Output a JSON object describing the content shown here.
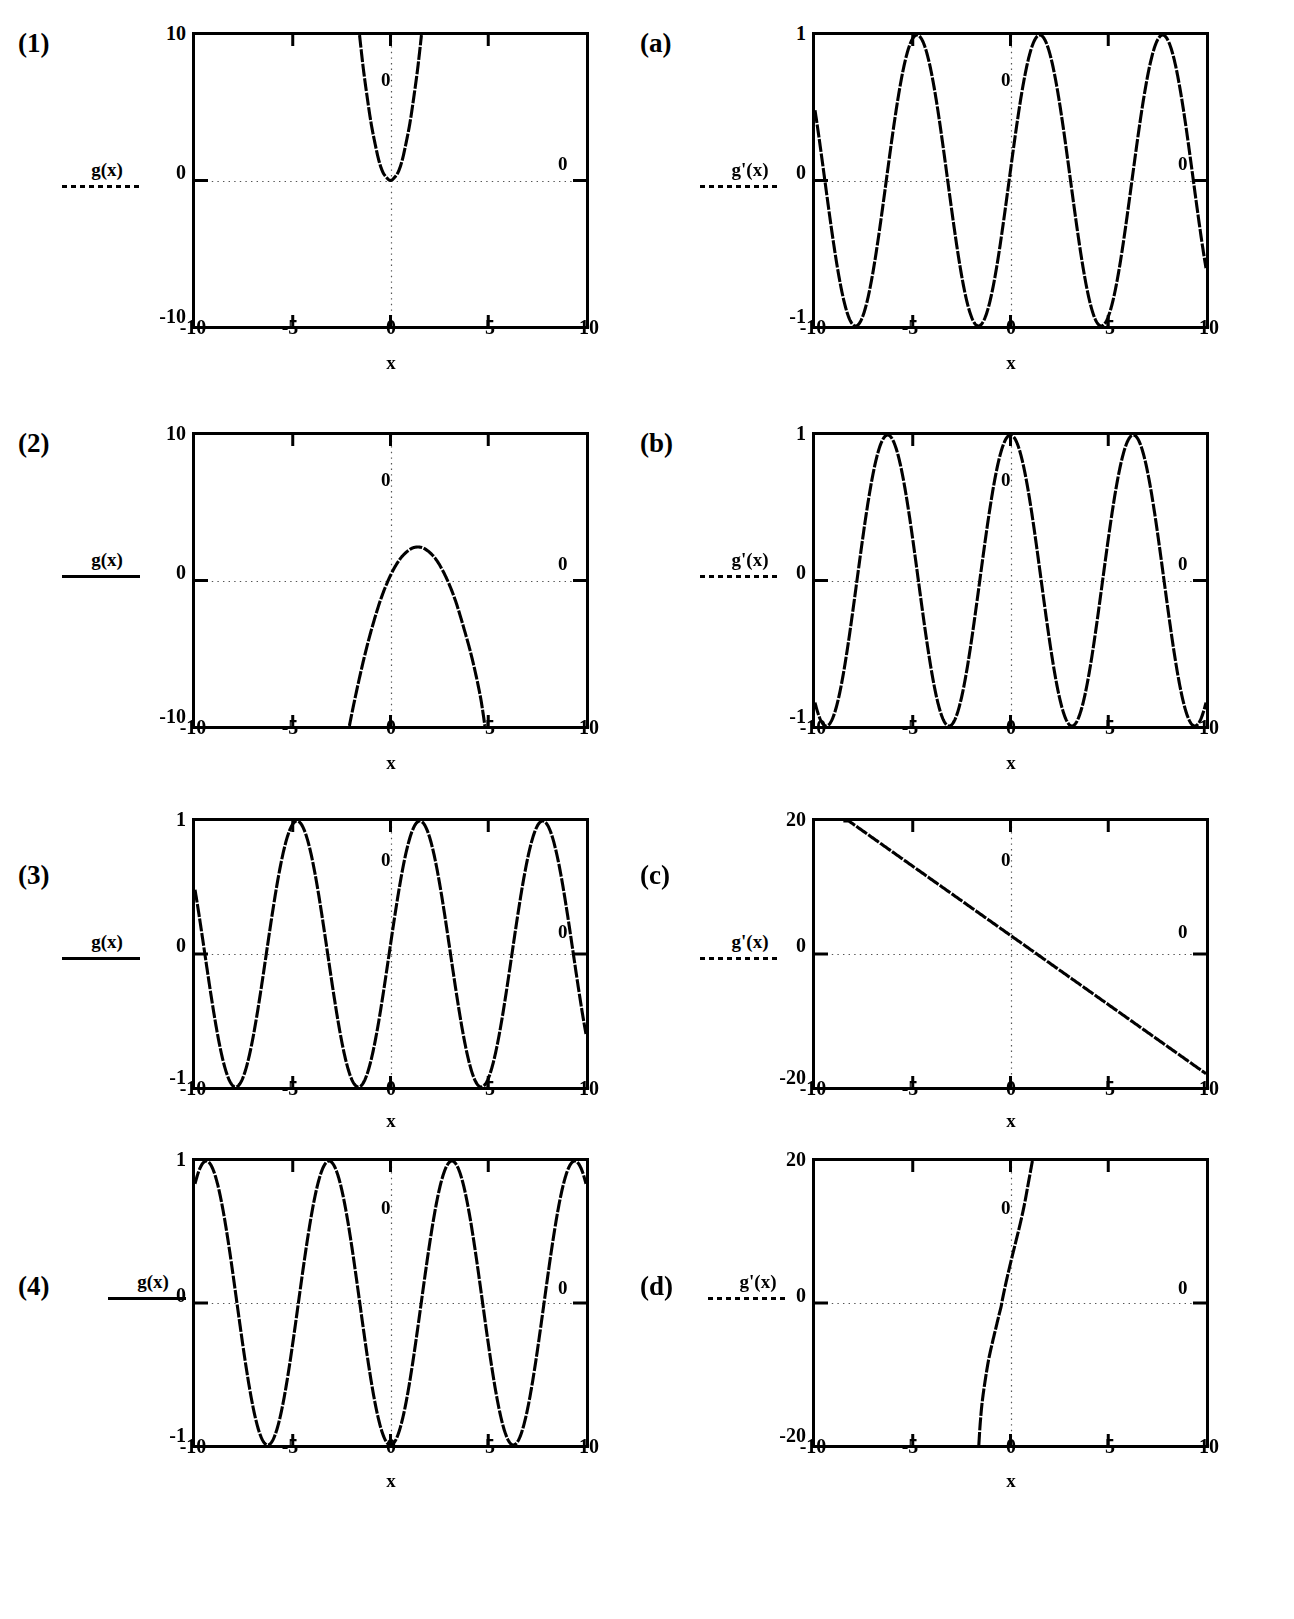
{
  "figure": {
    "background": "#ffffff",
    "ink": "#000000",
    "grid_note": "dotted reference lines at x=0 and y=0 inside each frame",
    "panel_count": 8
  },
  "panels": [
    {
      "tag": "(1)",
      "legend_label": "g(x)",
      "legend_style": "dotted",
      "xlabel": "x",
      "xticks": [
        "-10",
        "-5",
        "0",
        "5",
        "10"
      ],
      "yticks": [
        "10",
        "0",
        "-10"
      ],
      "inner_zero_labels": [
        "0",
        "0"
      ],
      "chart_data": {
        "type": "line",
        "title": "",
        "xlabel": "x",
        "ylabel": "g(x)",
        "xlim": [
          -10,
          10
        ],
        "ylim": [
          -10,
          10
        ],
        "xticks": [
          -10,
          -5,
          0,
          5,
          10
        ],
        "yticks": [
          -10,
          0,
          10
        ],
        "grid": "dotted zero lines only",
        "legend": "g(x)",
        "curve": "parabola-upward",
        "description": "Narrow upward parabola with vertex near (0,0); rises off the top of the frame at x = -1.6 and x = 1.6",
        "series": [
          {
            "name": "g(x)",
            "expression": "4*x^2",
            "points": [
              {
                "x": -1.6,
                "y": 10.2
              },
              {
                "x": -1.4,
                "y": 7.8
              },
              {
                "x": -1.2,
                "y": 5.8
              },
              {
                "x": -1.0,
                "y": 4.0
              },
              {
                "x": -0.8,
                "y": 2.6
              },
              {
                "x": -0.6,
                "y": 1.4
              },
              {
                "x": -0.4,
                "y": 0.6
              },
              {
                "x": -0.2,
                "y": 0.2
              },
              {
                "x": 0.0,
                "y": 0.0
              },
              {
                "x": 0.2,
                "y": 0.2
              },
              {
                "x": 0.4,
                "y": 0.6
              },
              {
                "x": 0.6,
                "y": 1.4
              },
              {
                "x": 0.8,
                "y": 2.6
              },
              {
                "x": 1.0,
                "y": 4.0
              },
              {
                "x": 1.2,
                "y": 5.8
              },
              {
                "x": 1.4,
                "y": 7.8
              },
              {
                "x": 1.6,
                "y": 10.2
              }
            ]
          }
        ]
      }
    },
    {
      "tag": "(a)",
      "legend_label": "g'(x)",
      "legend_style": "dotted",
      "xlabel": "x",
      "xticks": [
        "-10",
        "-5",
        "0",
        "5",
        "10"
      ],
      "yticks": [
        "1",
        "0",
        "-1"
      ],
      "inner_zero_labels": [
        "0",
        "0"
      ],
      "chart_data": {
        "type": "line",
        "title": "",
        "xlabel": "x",
        "ylabel": "g'(x)",
        "xlim": [
          -10,
          10
        ],
        "ylim": [
          -1,
          1
        ],
        "xticks": [
          -10,
          -5,
          0,
          5,
          10
        ],
        "yticks": [
          -1,
          0,
          1
        ],
        "grid": "dotted zero lines only",
        "legend": "g'(x)",
        "curve": "cosine-shifted",
        "description": "Sinusoid of amplitude 1, period about 6.3, peaks near x = -5.0, 1.5, 7.8 and troughs near x = -8.1, -1.6, 4.7",
        "series": [
          {
            "name": "g'(x)",
            "expression": "cos(x - 1.5)",
            "amplitude": 1,
            "period": 6.283,
            "phase_peak_x": 1.5,
            "peaks": [
              -4.78,
              1.5,
              7.78
            ],
            "troughs": [
              -7.92,
              -1.64,
              4.64
            ],
            "zero_crossings": [
              -9.5,
              -6.35,
              -3.2,
              -0.07,
              3.07,
              6.21,
              9.35
            ]
          }
        ]
      }
    },
    {
      "tag": "(2)",
      "legend_label": "g(x)",
      "legend_style": "solid",
      "xlabel": "x",
      "xticks": [
        "-10",
        "-5",
        "0",
        "5",
        "10"
      ],
      "yticks": [
        "10",
        "0",
        "-10"
      ],
      "inner_zero_labels": [
        "0",
        "0"
      ],
      "chart_data": {
        "type": "line",
        "title": "",
        "xlabel": "x",
        "ylabel": "g(x)",
        "xlim": [
          -10,
          10
        ],
        "ylim": [
          -10,
          10
        ],
        "xticks": [
          -10,
          -5,
          0,
          5,
          10
        ],
        "yticks": [
          -10,
          0,
          10
        ],
        "grid": "dotted zero lines only",
        "legend": "g(x)",
        "curve": "parabola-downward",
        "description": "Downward parabola, vertex near (1.4, 2.3), leaves the bottom of the frame at x = -2.1 and x = 4.8",
        "series": [
          {
            "name": "g(x)",
            "expression": "-(x-1.4)^2 + 2.3",
            "vertex": {
              "x": 1.4,
              "y": 2.3
            },
            "points": [
              {
                "x": -2.15,
                "y": -10.3
              },
              {
                "x": -1.8,
                "y": -8.0
              },
              {
                "x": -1.4,
                "y": -5.6
              },
              {
                "x": -1.0,
                "y": -3.5
              },
              {
                "x": -0.5,
                "y": -1.3
              },
              {
                "x": 0.0,
                "y": 0.35
              },
              {
                "x": 0.5,
                "y": 1.5
              },
              {
                "x": 1.0,
                "y": 2.14
              },
              {
                "x": 1.4,
                "y": 2.3
              },
              {
                "x": 1.8,
                "y": 2.14
              },
              {
                "x": 2.3,
                "y": 1.5
              },
              {
                "x": 2.8,
                "y": 0.34
              },
              {
                "x": 3.3,
                "y": -1.3
              },
              {
                "x": 3.8,
                "y": -3.5
              },
              {
                "x": 4.2,
                "y": -5.5
              },
              {
                "x": 4.6,
                "y": -8.0
              },
              {
                "x": 4.85,
                "y": -10.2
              }
            ]
          }
        ]
      }
    },
    {
      "tag": "(b)",
      "legend_label": "g'(x)",
      "legend_style": "dotted",
      "xlabel": "x",
      "xticks": [
        "-10",
        "-5",
        "0",
        "5",
        "10"
      ],
      "yticks": [
        "1",
        "0",
        "-1"
      ],
      "inner_zero_labels": [
        "0",
        "0"
      ],
      "chart_data": {
        "type": "line",
        "title": "",
        "xlabel": "x",
        "ylabel": "g'(x)",
        "xlim": [
          -10,
          10
        ],
        "ylim": [
          -1,
          1
        ],
        "xticks": [
          -10,
          -5,
          0,
          5,
          10
        ],
        "yticks": [
          -1,
          0,
          1
        ],
        "grid": "dotted zero lines only",
        "legend": "g'(x)",
        "curve": "cosine",
        "description": "cos(x): amplitude 1, period 2*pi, peaks at x = -6.28, 0, 6.28 and troughs at x = -9.42, -3.14, 3.14, 9.42",
        "series": [
          {
            "name": "g'(x)",
            "expression": "cos(x)",
            "amplitude": 1,
            "period": 6.283,
            "peaks": [
              -6.28,
              0,
              6.28
            ],
            "troughs": [
              -9.42,
              -3.14,
              3.14,
              9.42
            ],
            "zero_crossings": [
              -7.85,
              -4.71,
              -1.57,
              1.57,
              4.71,
              7.85
            ]
          }
        ]
      }
    },
    {
      "tag": "(3)",
      "legend_label": "g(x)",
      "legend_style": "solid",
      "xlabel": "x",
      "xticks": [
        "-10",
        "-5",
        "0",
        "5",
        "10"
      ],
      "yticks": [
        "1",
        "0",
        "-1"
      ],
      "inner_zero_labels": [
        "0",
        "0"
      ],
      "chart_data": {
        "type": "line",
        "title": "",
        "xlabel": "x",
        "ylabel": "g(x)",
        "xlim": [
          -10,
          10
        ],
        "ylim": [
          -1,
          1
        ],
        "xticks": [
          -10,
          -5,
          0,
          5,
          10
        ],
        "yticks": [
          -1,
          0,
          1
        ],
        "grid": "dotted zero lines only",
        "legend": "g(x)",
        "curve": "sine-shifted",
        "description": "Sinusoid of amplitude 1, period about 6.3, peaks near x = -5.0, 1.5, 7.8 and troughs near x = -8.1, -1.6, 4.7",
        "series": [
          {
            "name": "g(x)",
            "expression": "cos(x - 1.5)",
            "amplitude": 1,
            "period": 6.283,
            "peaks": [
              -4.78,
              1.5,
              7.78
            ],
            "troughs": [
              -7.92,
              -1.64,
              4.64
            ],
            "zero_crossings": [
              -9.5,
              -6.35,
              -3.2,
              -0.07,
              3.07,
              6.21,
              9.35
            ]
          }
        ]
      }
    },
    {
      "tag": "(c)",
      "legend_label": "g'(x)",
      "legend_style": "dotted",
      "xlabel": "x",
      "xticks": [
        "-10",
        "-5",
        "0",
        "5",
        "10"
      ],
      "yticks": [
        "20",
        "0",
        "-20"
      ],
      "inner_zero_labels": [
        "0",
        "0"
      ],
      "chart_data": {
        "type": "line",
        "title": "",
        "xlabel": "x",
        "ylabel": "g'(x)",
        "xlim": [
          -10,
          10
        ],
        "ylim": [
          -20,
          20
        ],
        "xticks": [
          -10,
          -5,
          0,
          5,
          10
        ],
        "yticks": [
          -20,
          0,
          20
        ],
        "grid": "dotted zero lines only",
        "legend": "g'(x)",
        "curve": "straight-line-negative-slope",
        "description": "Descending straight line; reaches 20 at x = -8.5, passes y = 2.8 at x = 0, crosses zero near x = 1.4 and reaches about -18 at x = 10",
        "series": [
          {
            "name": "g'(x)",
            "expression": "2.8 - 2*x",
            "slope": -2.08,
            "intercept": 2.8,
            "points": [
              {
                "x": -8.5,
                "y": 20.0
              },
              {
                "x": -5,
                "y": 13.2
              },
              {
                "x": 0,
                "y": 2.8
              },
              {
                "x": 1.35,
                "y": 0.0
              },
              {
                "x": 5,
                "y": -7.6
              },
              {
                "x": 10,
                "y": -18.0
              }
            ]
          }
        ]
      }
    },
    {
      "tag": "(4)",
      "legend_label": "g(x)",
      "legend_style": "solid",
      "xlabel": "x",
      "xticks": [
        "-10",
        "-5",
        "0",
        "5",
        "10"
      ],
      "yticks": [
        "1",
        "0",
        "-1"
      ],
      "inner_zero_labels": [
        "0",
        "0"
      ],
      "chart_data": {
        "type": "line",
        "title": "",
        "xlabel": "x",
        "ylabel": "g(x)",
        "xlim": [
          -10,
          10
        ],
        "ylim": [
          -1,
          1
        ],
        "xticks": [
          -10,
          -5,
          0,
          5,
          10
        ],
        "yticks": [
          -1,
          0,
          1
        ],
        "grid": "dotted zero lines only",
        "legend": "g(x)",
        "curve": "negative-cosine",
        "description": "-cos(x): amplitude 1, period 2*pi, troughs at x = -6.28, 0, 6.28 and peaks at x = -9.42, -3.14, 3.14, 9.42",
        "series": [
          {
            "name": "g(x)",
            "expression": "-cos(x)",
            "amplitude": 1,
            "period": 6.283,
            "peaks": [
              -9.42,
              -3.14,
              3.14,
              9.42
            ],
            "troughs": [
              -6.28,
              0,
              6.28
            ],
            "zero_crossings": [
              -7.85,
              -4.71,
              -1.57,
              1.57,
              4.71,
              7.85
            ]
          }
        ]
      }
    },
    {
      "tag": "(d)",
      "legend_label": "g'(x)",
      "legend_style": "dotted",
      "xlabel": "x",
      "xticks": [
        "-10",
        "-5",
        "0",
        "5",
        "10"
      ],
      "yticks": [
        "20",
        "0",
        "-20"
      ],
      "inner_zero_labels": [
        "0",
        "0"
      ],
      "chart_data": {
        "type": "line",
        "title": "",
        "xlabel": "x",
        "ylabel": "g'(x)",
        "xlim": [
          -10,
          10
        ],
        "ylim": [
          -20,
          20
        ],
        "xticks": [
          -10,
          -5,
          0,
          5,
          10
        ],
        "yticks": [
          -20,
          0,
          20
        ],
        "grid": "dotted zero lines only",
        "legend": "g'(x)",
        "curve": "steep-rising-sigmoid",
        "description": "Very steep rising curve; enters the bottom of the frame near x = -1.6, has a flat inflection shoulder near (-0.45, 0), and exits the top of the frame near x = 1.15",
        "series": [
          {
            "name": "g'(x)",
            "expression": "steep odd cubic through (-0.45, 0)",
            "points": [
              {
                "x": -1.62,
                "y": -20.0
              },
              {
                "x": -1.55,
                "y": -17.0
              },
              {
                "x": -1.45,
                "y": -14.0
              },
              {
                "x": -1.3,
                "y": -11.0
              },
              {
                "x": -1.12,
                "y": -8.0
              },
              {
                "x": -0.92,
                "y": -5.5
              },
              {
                "x": -0.72,
                "y": -3.2
              },
              {
                "x": -0.58,
                "y": -1.6
              },
              {
                "x": -0.48,
                "y": -0.5
              },
              {
                "x": -0.42,
                "y": 0.4
              },
              {
                "x": -0.33,
                "y": 1.6
              },
              {
                "x": -0.22,
                "y": 3.0
              },
              {
                "x": 0.0,
                "y": 5.6
              },
              {
                "x": 0.25,
                "y": 8.4
              },
              {
                "x": 0.5,
                "y": 11.2
              },
              {
                "x": 0.72,
                "y": 14.0
              },
              {
                "x": 0.92,
                "y": 17.0
              },
              {
                "x": 1.12,
                "y": 20.0
              }
            ]
          }
        ]
      }
    }
  ]
}
